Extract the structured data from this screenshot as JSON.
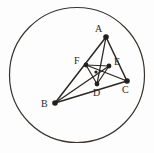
{
  "figure": {
    "kind": "euclidean-geometry-diagram",
    "canvas": {
      "width": 154,
      "height": 153
    },
    "colors": {
      "background": "#fdfdfd",
      "stroke": "#2b2723",
      "circle_stroke": "#3a332d",
      "label_text": "#2b2723",
      "vertex_dot": "#241f1b"
    },
    "circle": {
      "cx": 77,
      "cy": 75,
      "r": 67.5,
      "stroke_width": 1.2
    },
    "points": [
      {
        "id": "A",
        "label": "A",
        "x": 106,
        "y": 37,
        "label_x": 95,
        "label_y": 24,
        "dot_r": 2.8
      },
      {
        "id": "B",
        "label": "B",
        "x": 55,
        "y": 103,
        "label_x": 41,
        "label_y": 99,
        "dot_r": 2.8
      },
      {
        "id": "C",
        "label": "C",
        "x": 127,
        "y": 81,
        "label_x": 122,
        "label_y": 85,
        "dot_r": 2.8
      },
      {
        "id": "D",
        "label": "D",
        "x": 97,
        "y": 84,
        "label_x": 93,
        "label_y": 88,
        "dot_r": 2.4
      },
      {
        "id": "E",
        "label": "E",
        "x": 109,
        "y": 66,
        "label_x": 114,
        "label_y": 57,
        "dot_r": 2.4
      },
      {
        "id": "F",
        "label": "F",
        "x": 86,
        "y": 65,
        "label_x": 74,
        "label_y": 56,
        "dot_r": 2.4
      },
      {
        "id": "G",
        "label": "",
        "x": 96,
        "y": 72,
        "label_x": 0,
        "label_y": 0,
        "dot_r": 1.6
      }
    ],
    "segments": [
      {
        "name": "side-AB",
        "from": "A",
        "to": "B",
        "width": 1.5
      },
      {
        "name": "side-BC",
        "from": "B",
        "to": "C",
        "width": 1.5
      },
      {
        "name": "side-CA",
        "from": "C",
        "to": "A",
        "width": 1.5
      },
      {
        "name": "cevian-AD",
        "from": "A",
        "to": "D",
        "width": 1.3
      },
      {
        "name": "cevian-BE",
        "from": "B",
        "to": "E",
        "width": 1.3
      },
      {
        "name": "cevian-CF",
        "from": "C",
        "to": "F",
        "width": 1.3
      },
      {
        "name": "inner-DE",
        "from": "D",
        "to": "E",
        "width": 1.2
      },
      {
        "name": "inner-EF",
        "from": "E",
        "to": "F",
        "width": 1.2
      },
      {
        "name": "inner-FD",
        "from": "F",
        "to": "D",
        "width": 1.2
      }
    ]
  }
}
